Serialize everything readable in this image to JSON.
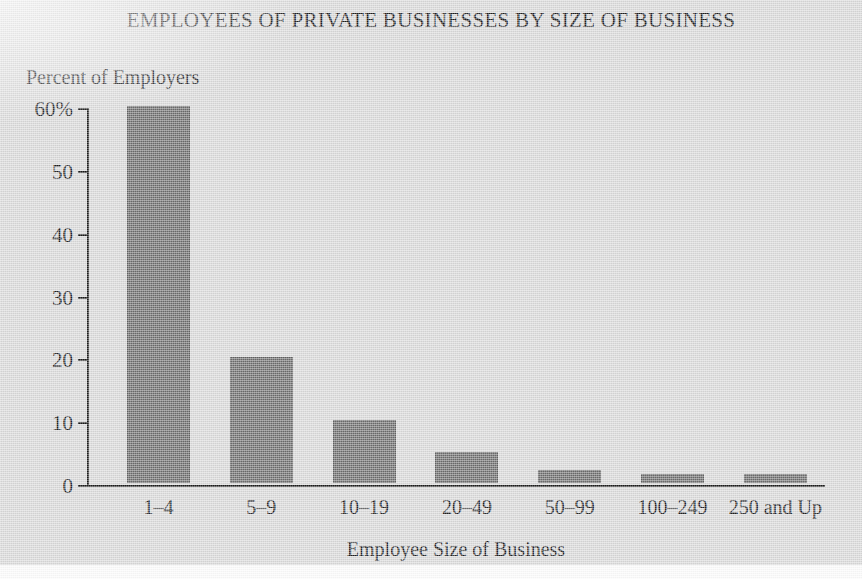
{
  "chart_data": {
    "type": "bar",
    "title": "EMPLOYEES OF PRIVATE BUSINESSES BY SIZE OF BUSINESS",
    "xlabel": "Employee Size of Business",
    "ylabel": "Percent of Employers",
    "categories": [
      "1–4",
      "5–9",
      "10–19",
      "20–49",
      "50–99",
      "100–249",
      "250 and Up"
    ],
    "values": [
      60,
      20,
      10,
      5,
      2,
      1.5,
      1.5
    ],
    "ylim": [
      0,
      60
    ],
    "yticks": [
      0,
      10,
      20,
      30,
      40,
      50,
      60
    ],
    "ytick_labels": [
      "0",
      "10",
      "20",
      "30",
      "40",
      "50",
      "60%"
    ],
    "grid": false,
    "legend": false,
    "bar_color": "#6d6d6d",
    "axis_color": "#1d1d1c",
    "background_color": "#d9d9d9"
  }
}
